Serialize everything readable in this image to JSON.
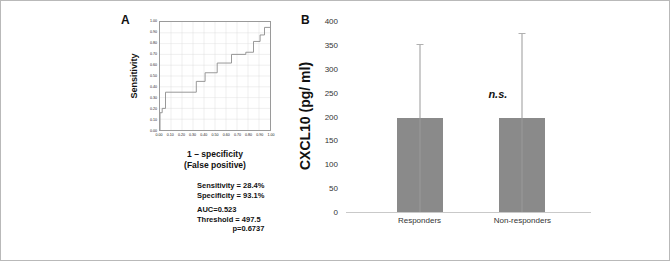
{
  "figure": {
    "panel_a_letter": "A",
    "panel_b_letter": "B"
  },
  "chart_data": [
    {
      "type": "line",
      "panel": "A",
      "title": "",
      "xlabel_line1": "1 – specificity",
      "xlabel_line2": "(False positive)",
      "ylabel": "Sensitivity",
      "xlim": [
        0,
        1
      ],
      "ylim": [
        0,
        1
      ],
      "grid": true,
      "xticks": [
        "0.00",
        "0.10",
        "0.20",
        "0.30",
        "0.40",
        "0.50",
        "0.60",
        "0.70",
        "0.80",
        "0.90",
        "1.00"
      ],
      "yticks": [
        "0.00",
        "0.10",
        "0.20",
        "0.30",
        "0.40",
        "0.50",
        "0.60",
        "0.70",
        "0.80",
        "0.90",
        "1.00"
      ],
      "series": [
        {
          "name": "ROC curve",
          "x": [
            0.0,
            0.0,
            0.02,
            0.02,
            0.05,
            0.05,
            0.33,
            0.33,
            0.41,
            0.41,
            0.52,
            0.52,
            0.65,
            0.65,
            0.78,
            0.78,
            0.85,
            0.85,
            0.91,
            0.91,
            0.95,
            0.95,
            1.0
          ],
          "y": [
            0.0,
            0.16,
            0.16,
            0.2,
            0.2,
            0.35,
            0.35,
            0.45,
            0.45,
            0.53,
            0.53,
            0.62,
            0.62,
            0.7,
            0.7,
            0.72,
            0.72,
            0.82,
            0.82,
            0.88,
            0.88,
            0.95,
            0.95
          ]
        }
      ],
      "annotations": {
        "sensitivity": "Sensitivity = 28.4%",
        "specificity": "Specificity = 93.1%",
        "auc": "AUC=0.523",
        "threshold": "Threshold = 497.5",
        "pvalue": "p=0.6737"
      }
    },
    {
      "type": "bar",
      "panel": "B",
      "title": "",
      "xlabel": "",
      "ylabel": "CXCL10 (pg/ ml)",
      "ylim": [
        0,
        400
      ],
      "yticks": [
        "0",
        "50",
        "100",
        "150",
        "200",
        "250",
        "300",
        "350",
        "400"
      ],
      "ytick_values": [
        0,
        50,
        100,
        150,
        200,
        250,
        300,
        350,
        400
      ],
      "grid": false,
      "categories": [
        "Responders",
        "Non-responders"
      ],
      "values": [
        196,
        196
      ],
      "errors_upper": [
        350,
        372
      ],
      "annotation": "n.s."
    }
  ]
}
